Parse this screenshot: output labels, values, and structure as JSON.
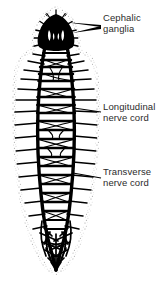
{
  "figure": {
    "background_color": "#ffffff",
    "ink_color": "#000000",
    "text_color": "#2b2b2b",
    "body_outline_color": "#8f8f8f",
    "body_fill_color": "#ffffff"
  },
  "labels": [
    {
      "id": "cephalic-ganglia",
      "line1": "Cephalic",
      "line2": "ganglia",
      "leader": "double-arrow-to-head"
    },
    {
      "id": "longitudinal-nerve-cord",
      "line1": "Longitudinal",
      "line2": "nerve cord",
      "leader": "single-line-to-right-cord"
    },
    {
      "id": "transverse-nerve-cord",
      "line1": "Transverse",
      "line2": "nerve cord",
      "leader": "single-line-to-rung"
    }
  ],
  "anatomy": {
    "cephalic_ganglia": "dark bilobed brain mass at anterior end with two pale eyespot notches",
    "longitudinal_nerve_cords": 2,
    "transverse_nerve_cords": 22,
    "tail_plexus": "converging net of fine nerve branches at posterior tip"
  }
}
